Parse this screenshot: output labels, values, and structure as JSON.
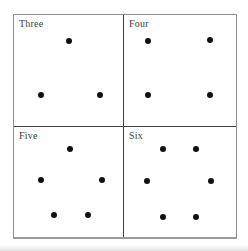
{
  "figure": {
    "colors": {
      "background": "#ffffff",
      "dot": "#111111",
      "border_outer": "#8f8f8f",
      "border_outer_bottom": "#9b9b9b",
      "border_inner": "#404040",
      "label_text": "#3c3c3c"
    },
    "panels": [
      {
        "label": "Three",
        "count": 3,
        "arrangement": "triangle",
        "dots": [
          {
            "x": 50.7,
            "y": 23.0
          },
          {
            "x": 24.4,
            "y": 71.7
          },
          {
            "x": 78.7,
            "y": 71.7
          }
        ]
      },
      {
        "label": "Four",
        "count": 4,
        "arrangement": "square",
        "dots": [
          {
            "x": 21.6,
            "y": 23.0
          },
          {
            "x": 77.1,
            "y": 22.1
          },
          {
            "x": 21.6,
            "y": 71.7
          },
          {
            "x": 77.1,
            "y": 71.7
          }
        ]
      },
      {
        "label": "Five",
        "count": 5,
        "arrangement": "pentagon",
        "dots": [
          {
            "x": 51.6,
            "y": 19.8
          },
          {
            "x": 24.4,
            "y": 48.6
          },
          {
            "x": 80.5,
            "y": 48.6
          },
          {
            "x": 37.1,
            "y": 80.2
          },
          {
            "x": 67.9,
            "y": 80.2
          }
        ]
      },
      {
        "label": "Six",
        "count": 6,
        "arrangement": "hexagon",
        "dots": [
          {
            "x": 34.8,
            "y": 19.8
          },
          {
            "x": 63.9,
            "y": 19.8
          },
          {
            "x": 20.7,
            "y": 49.5
          },
          {
            "x": 78.0,
            "y": 49.5
          },
          {
            "x": 34.8,
            "y": 82.0
          },
          {
            "x": 63.9,
            "y": 82.0
          }
        ]
      }
    ]
  }
}
